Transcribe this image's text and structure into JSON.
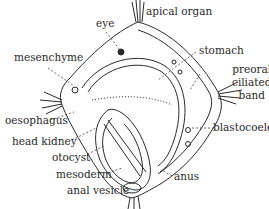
{
  "diagram": {
    "ink_color": "#2a2a2a",
    "labels": [
      {
        "id": "eye",
        "text": "eye"
      },
      {
        "id": "apical-organ",
        "text": "apical organ"
      },
      {
        "id": "mesenchyme",
        "text": "mesenchyme"
      },
      {
        "id": "stomach",
        "text": "stomach"
      },
      {
        "id": "preoral-ciliated-band",
        "text": "preoral\nciliated\nband",
        "lines": [
          "preoral",
          "ciliated",
          "band"
        ]
      },
      {
        "id": "oesophagus",
        "text": "oesophagus"
      },
      {
        "id": "blastocoele",
        "text": "blastocoele"
      },
      {
        "id": "head-kidney",
        "text": "head kidney"
      },
      {
        "id": "otocyst",
        "text": "otocyst"
      },
      {
        "id": "anus",
        "text": "anus"
      },
      {
        "id": "mesoderm",
        "text": "mesoderm"
      },
      {
        "id": "anal-vesicle",
        "text": "anal vesicle"
      }
    ]
  }
}
